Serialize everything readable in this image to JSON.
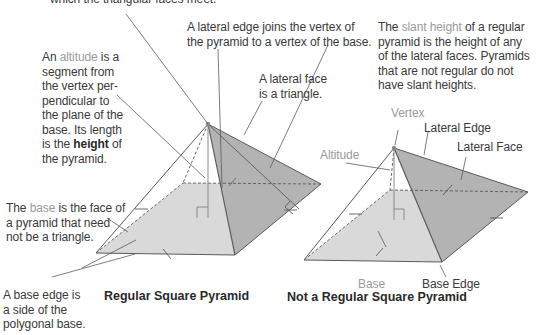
{
  "colors": {
    "front_face": "#d9d9d9",
    "side_face": "#b3b3b3",
    "edge": "#5a5a5a",
    "text": "#3a3a3a",
    "gray_text": "#9a9a9a",
    "vertex_dot": "#8a8a8a"
  },
  "labels": {
    "vertex_note_tail": "which the triangular faces meet.",
    "lateral_edge_note": {
      "line1": "A lateral edge joins the vertex of",
      "line2": "the pyramid to a vertex of the base."
    },
    "slant_height_note": {
      "pre": "The ",
      "term": "slant height",
      "line1_post": " of a regular",
      "line2": "pyramid is the height of any",
      "line3": "of the lateral faces. Pyramids",
      "line4": "that are not regular do not",
      "line5": "have slant heights."
    },
    "altitude_note": {
      "pre": "An ",
      "term": "altitude",
      "post": " is a",
      "line2": "segment from",
      "line3": "the vertex per-",
      "line4": "pendicular to",
      "line5": "the plane of the",
      "line6": "base. Its length",
      "line7_pre": "is the ",
      "line7_term": "height",
      "line7_post": " of",
      "line8": "the pyramid."
    },
    "lateral_face_note": {
      "line1": "A lateral face",
      "line2": "is a triangle."
    },
    "base_note": {
      "pre": "The ",
      "term": "base",
      "line1_post": " is the face of",
      "line2": "a pyramid that need",
      "line3": "not be a triangle."
    },
    "base_edge_note": {
      "line1": "A base edge is",
      "line2": "a side of the",
      "line3": "polygonal base."
    },
    "right_figure": {
      "vertex": "Vertex",
      "lateral_edge": "Lateral Edge",
      "lateral_face": "Lateral Face",
      "altitude": "Altitude",
      "base": "Base",
      "base_edge": "Base Edge"
    }
  },
  "captions": {
    "left": "Regular Square Pyramid",
    "right": "Not a Regular Square Pyramid"
  }
}
